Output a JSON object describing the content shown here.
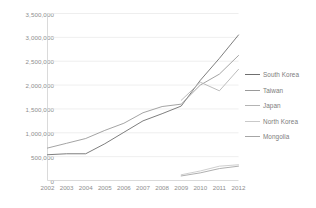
{
  "chart_data": {
    "type": "line",
    "title": "",
    "subtitle": "",
    "xlabel": "",
    "ylabel": "",
    "categories": [
      "2002",
      "2003",
      "2004",
      "2005",
      "2006",
      "2007",
      "2008",
      "2009",
      "2010",
      "2011",
      "2012"
    ],
    "x": [
      2002,
      2003,
      2004,
      2005,
      2006,
      2007,
      2008,
      2009,
      2010,
      2011,
      2012
    ],
    "xlim": [
      2002,
      2012
    ],
    "ylim": [
      0,
      3500000
    ],
    "yticks": [
      0,
      500000,
      1000000,
      1500000,
      2000000,
      2500000,
      3000000,
      3500000
    ],
    "ytick_labels": [
      "0",
      "500,000",
      "1,000,000",
      "1,500,000",
      "2,000,000",
      "2,500,000",
      "3,000,000",
      "3,500,000"
    ],
    "grid": true,
    "grid_axis": "y",
    "legend_position": "right",
    "series": [
      {
        "name": "South Korea",
        "color": "#6f6f6f",
        "values": [
          540000,
          560000,
          560000,
          770000,
          1010000,
          1250000,
          1400000,
          1560000,
          2100000,
          2560000,
          3050000
        ]
      },
      {
        "name": "Taiwan",
        "color": "#9a9a9a",
        "values": [
          680000,
          780000,
          880000,
          1050000,
          1200000,
          1420000,
          1550000,
          1600000,
          2000000,
          2230000,
          2620000
        ]
      },
      {
        "name": "Japan",
        "color": "#b4b4b4",
        "values": [
          null,
          null,
          null,
          null,
          null,
          null,
          null,
          1680000,
          2060000,
          1880000,
          2330000
        ]
      },
      {
        "name": "North Korea",
        "color": "#c9c9c9",
        "values": [
          null,
          null,
          null,
          null,
          null,
          null,
          null,
          120000,
          200000,
          300000,
          330000
        ]
      },
      {
        "name": "Mongolia",
        "color": "#a6a6a6",
        "values": [
          null,
          null,
          null,
          null,
          null,
          null,
          null,
          95000,
          160000,
          250000,
          300000
        ]
      }
    ]
  },
  "axes": {
    "y_labels": [
      "3,500,000",
      "3,000,000",
      "2,500,000",
      "2,000,000",
      "1,500,000",
      "1,000,000",
      "500,000",
      "0"
    ],
    "x_labels": [
      "2002",
      "2003",
      "2004",
      "2005",
      "2006",
      "2007",
      "2008",
      "2009",
      "2010",
      "2011",
      "2012"
    ]
  },
  "legend": {
    "items": [
      {
        "label": "South Korea",
        "color": "#6f6f6f"
      },
      {
        "label": "Taiwan",
        "color": "#9a9a9a"
      },
      {
        "label": "Japan",
        "color": "#b4b4b4"
      },
      {
        "label": "North Korea",
        "color": "#c9c9c9"
      },
      {
        "label": "Mongolia",
        "color": "#a6a6a6"
      }
    ]
  },
  "style": {
    "background": "#ffffff",
    "grid_color": "#e6e6e6",
    "axis_color": "#d0d0d0",
    "tick_text_color": "#8e8e8e",
    "legend_text_color": "#7d7d7d"
  }
}
